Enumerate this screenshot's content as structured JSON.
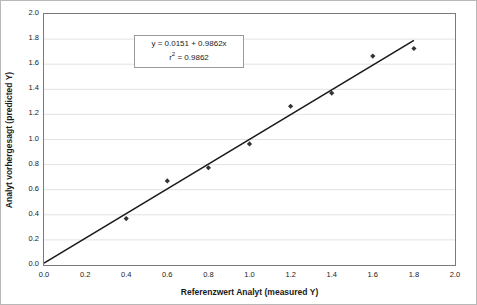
{
  "chart_data": {
    "type": "scatter",
    "title": "",
    "xlabel": "Referenzwert Analyt (measured Y)",
    "ylabel": "Analyt vorhergesagt (predicted Y)",
    "xlim": [
      0.0,
      2.0
    ],
    "ylim": [
      0.0,
      2.0
    ],
    "xticks": [
      "0.0",
      "0.2",
      "0.4",
      "0.6",
      "0.8",
      "1.0",
      "1.2",
      "1.4",
      "1.6",
      "1.8",
      "2.0"
    ],
    "yticks": [
      "0.0",
      "0.2",
      "0.4",
      "0.6",
      "0.8",
      "1.0",
      "1.2",
      "1.4",
      "1.6",
      "1.8",
      "2.0"
    ],
    "xtick_values": [
      0.0,
      0.2,
      0.4,
      0.6,
      0.8,
      1.0,
      1.2,
      1.4,
      1.6,
      1.8,
      2.0
    ],
    "ytick_values": [
      0.0,
      0.2,
      0.4,
      0.6,
      0.8,
      1.0,
      1.2,
      1.4,
      1.6,
      1.8,
      2.0
    ],
    "grid": {
      "horizontal": true,
      "vertical": false,
      "color": "#e2e2e2"
    },
    "legend": null,
    "series": [
      {
        "name": "data-points",
        "marker": "diamond",
        "color": "#333333",
        "x": [
          0.4,
          0.6,
          0.8,
          1.0,
          1.2,
          1.4,
          1.6,
          1.8
        ],
        "y": [
          0.37,
          0.67,
          0.775,
          0.965,
          1.265,
          1.37,
          1.665,
          1.725
        ]
      },
      {
        "name": "regression-line",
        "type": "line",
        "color": "#1a1a1a",
        "x": [
          0.0,
          1.8
        ],
        "y": [
          0.0151,
          1.7903
        ]
      }
    ],
    "fit": {
      "slope": 0.9862,
      "intercept": 0.0151,
      "r_squared": 0.9862
    },
    "annotation": {
      "equation": "y = 0.0151 + 0.9862x",
      "r2_prefix": "r",
      "r2_exponent": "2",
      "r2_value": " = 0.9862"
    }
  }
}
